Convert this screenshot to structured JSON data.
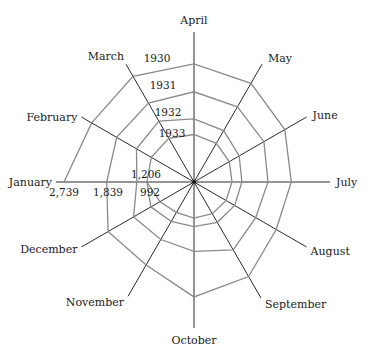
{
  "chart_data": {
    "type": "radar",
    "title": "",
    "categories": [
      "January",
      "February",
      "March",
      "April",
      "May",
      "June",
      "July",
      "August",
      "September",
      "October",
      "November",
      "December"
    ],
    "series": [
      {
        "name": "1930",
        "values": [
          2739,
          2490,
          2570,
          2490,
          2400,
          2210,
          2050,
          2000,
          2300,
          2420,
          2020,
          2090
        ]
      },
      {
        "name": "1931",
        "values": [
          1839,
          1880,
          1920,
          1900,
          1830,
          1700,
          1560,
          1500,
          1650,
          1460,
          1400,
          1470
        ]
      },
      {
        "name": "1932",
        "values": [
          1206,
          1400,
          1480,
          1330,
          1250,
          1100,
          1010,
          990,
          980,
          940,
          960,
          1050
        ]
      },
      {
        "name": "1933",
        "values": [
          992,
          1040,
          1060,
          1000,
          940,
          860,
          800,
          780,
          770,
          760,
          740,
          830
        ]
      }
    ],
    "annotations": {
      "january_values": [
        "2,739",
        "1,839",
        "1,206",
        "992"
      ],
      "series_labels": [
        "1930",
        "1931",
        "1932",
        "1933"
      ]
    },
    "rmax": 2739,
    "start_axis": "April",
    "direction": "clockwise",
    "grid": false,
    "legend": "none"
  }
}
